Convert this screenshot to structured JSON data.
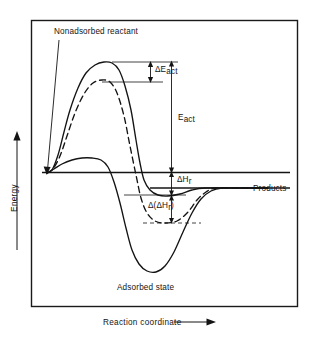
{
  "figure": {
    "frame": {
      "x": 31,
      "y": 20,
      "width": 267,
      "height": 287,
      "border_color": "#1a1a1a"
    },
    "background_color": "#ffffff",
    "ink_color": "#141414"
  },
  "axes": {
    "y_label": "Energy",
    "y_arrow": "up-arrow",
    "x_label": "Reaction coordinate",
    "x_arrow": "right-arrow",
    "baseline_label": "zero-energy-baseline"
  },
  "labels": {
    "nonadsorbed_reactant": "Nonadsorbed reactant",
    "adsorbed_state": "Adsorbed state",
    "products": "Products",
    "delta_e_act": {
      "main": "ΔE",
      "sub": "act"
    },
    "e_act": {
      "main": "E",
      "sub": "act"
    },
    "delta_h_r": {
      "main": "ΔH",
      "sub": "r"
    },
    "delta_delta_h_r": {
      "pre": "Δ(ΔH",
      "sub": "r",
      "post": ")"
    }
  },
  "chart_data": {
    "type": "line",
    "title": "",
    "xlabel": "Reaction coordinate",
    "ylabel": "Energy",
    "grid": false,
    "legend": false,
    "axis_ranges": {
      "x": [
        0,
        1
      ],
      "y": [
        -1,
        1
      ]
    },
    "annotations": [
      {
        "name": "nonadsorbed-reactant",
        "text": "Nonadsorbed reactant",
        "leader_from": [
          58,
          36
        ],
        "leader_to": [
          47,
          173
        ]
      },
      {
        "name": "e-act-arrow",
        "text": "E_act",
        "from": [
          171,
          62
        ],
        "to": [
          171,
          172
        ],
        "style": "double-arrow"
      },
      {
        "name": "delta-e-act-arrow",
        "text": "ΔE_act",
        "from": [
          150,
          62
        ],
        "to": [
          150,
          82
        ],
        "style": "double-arrow"
      },
      {
        "name": "delta-h-r-arrow",
        "text": "ΔH_r",
        "from": [
          171,
          172
        ],
        "to": [
          171,
          195
        ],
        "style": "double-arrow"
      },
      {
        "name": "delta-delta-h-r-arrow",
        "text": "Δ(ΔH_r)",
        "from": [
          171,
          195
        ],
        "to": [
          171,
          223
        ],
        "style": "double-arrow"
      },
      {
        "name": "products-line",
        "text": "Products",
        "y": 188
      },
      {
        "name": "adsorbed-state",
        "text": "Adsorbed state",
        "at": [
          152,
          287
        ]
      }
    ],
    "series": [
      {
        "name": "catalyzed-surface-reaction-solid",
        "style": "solid",
        "description": "Solid curve: highest activation barrier peak, shallow adsorbed well, ends at products level",
        "points": [
          [
            47,
            173
          ],
          [
            52,
            170
          ],
          [
            58,
            155
          ],
          [
            64,
            132
          ],
          [
            70,
            110
          ],
          [
            78,
            88
          ],
          [
            86,
            73
          ],
          [
            95,
            65
          ],
          [
            104,
            62
          ],
          [
            112,
            63
          ],
          [
            119,
            70
          ],
          [
            125,
            86
          ],
          [
            131,
            110
          ],
          [
            136,
            140
          ],
          [
            140,
            163
          ],
          [
            144,
            180
          ],
          [
            150,
            190
          ],
          [
            158,
            195
          ],
          [
            168,
            196
          ],
          [
            180,
            194
          ],
          [
            192,
            190
          ],
          [
            205,
            188
          ],
          [
            230,
            188
          ],
          [
            268,
            188
          ]
        ]
      },
      {
        "name": "modified-surface-reaction-dashed",
        "style": "dashed",
        "description": "Dashed curve: lower activation barrier peak, deeper adsorbed well, ends at products level",
        "points": [
          [
            47,
            173
          ],
          [
            53,
            169
          ],
          [
            60,
            156
          ],
          [
            67,
            136
          ],
          [
            75,
            113
          ],
          [
            84,
            94
          ],
          [
            93,
            83
          ],
          [
            102,
            80
          ],
          [
            110,
            82
          ],
          [
            117,
            93
          ],
          [
            124,
            116
          ],
          [
            130,
            146
          ],
          [
            136,
            175
          ],
          [
            141,
            198
          ],
          [
            147,
            213
          ],
          [
            155,
            221
          ],
          [
            165,
            223
          ],
          [
            177,
            221
          ],
          [
            188,
            212
          ],
          [
            197,
            200
          ],
          [
            206,
            192
          ],
          [
            216,
            188
          ],
          [
            240,
            188
          ],
          [
            268,
            188
          ]
        ]
      },
      {
        "name": "adsorbed-state-deep-well-solid",
        "style": "solid",
        "description": "Solid curve: small bump near baseline then deep adsorbed-state well, rising to products level",
        "points": [
          [
            47,
            173
          ],
          [
            54,
            169
          ],
          [
            62,
            164
          ],
          [
            72,
            160
          ],
          [
            82,
            158
          ],
          [
            92,
            158
          ],
          [
            101,
            160
          ],
          [
            108,
            167
          ],
          [
            114,
            182
          ],
          [
            120,
            203
          ],
          [
            126,
            228
          ],
          [
            132,
            250
          ],
          [
            139,
            264
          ],
          [
            147,
            271
          ],
          [
            156,
            272
          ],
          [
            165,
            266
          ],
          [
            174,
            252
          ],
          [
            183,
            232
          ],
          [
            192,
            213
          ],
          [
            201,
            199
          ],
          [
            211,
            191
          ],
          [
            222,
            188
          ],
          [
            245,
            188
          ],
          [
            268,
            188
          ]
        ]
      }
    ],
    "reference_lines": [
      {
        "name": "peak-top-tick-line",
        "from": [
          112,
          62
        ],
        "to": [
          178,
          62
        ]
      },
      {
        "name": "dashed-peak-tick-line",
        "from": [
          104,
          82
        ],
        "to": [
          162,
          82
        ]
      },
      {
        "name": "baseline",
        "from": [
          42,
          172
        ],
        "to": [
          290,
          172
        ]
      },
      {
        "name": "products-level-line",
        "from": [
          150,
          188
        ],
        "to": [
          290,
          188
        ]
      },
      {
        "name": "solid-well-bottom-line",
        "from": [
          126,
          195
        ],
        "to": [
          185,
          195
        ]
      },
      {
        "name": "dashed-well-bottom-line",
        "from": [
          145,
          223
        ],
        "to": [
          200,
          223
        ]
      }
    ]
  }
}
